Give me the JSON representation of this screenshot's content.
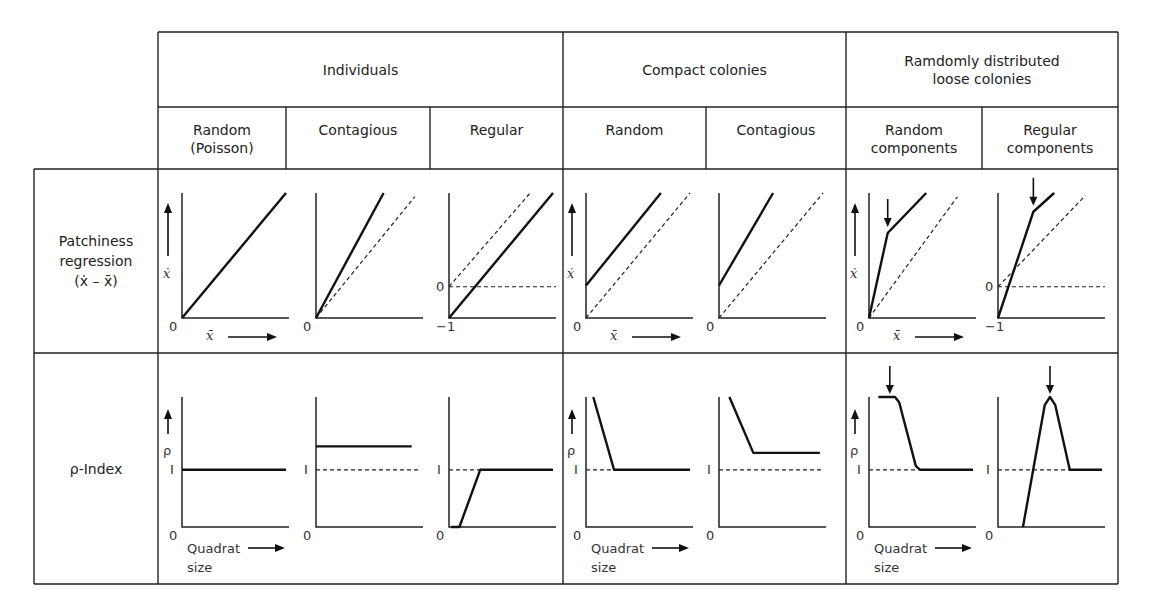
{
  "table": {
    "groups": [
      {
        "label": "Individuals"
      },
      {
        "label": "Compact colonies"
      },
      {
        "label": "Ramdomly distributed\nloose colonies"
      }
    ],
    "columns": [
      {
        "label": "Random\n(Poisson)"
      },
      {
        "label": "Contagious"
      },
      {
        "label": "Regular"
      },
      {
        "label": "Random"
      },
      {
        "label": "Contagious"
      },
      {
        "label": "Random\ncomponents"
      },
      {
        "label": "Regular\ncomponents"
      }
    ],
    "rows": [
      {
        "label": "Patchiness\nregression\n(ẋ – x̄)"
      },
      {
        "label": "ρ-Index"
      }
    ]
  },
  "axis_labels": {
    "top_y": "ẋ",
    "top_x": "x̄",
    "bottom_y": "ρ",
    "bottom_x_line1": "Quadrat",
    "bottom_x_line2": "size",
    "zero": "0",
    "minus_one": "−1",
    "one": "I"
  },
  "chart_data": [
    {
      "row": "Patchiness regression (ẋ – x̄)",
      "type": "line",
      "xlabel": "x̄",
      "ylabel": "ẋ",
      "panels": [
        {
          "column": "Random (Poisson)",
          "solid": [
            [
              0,
              0
            ],
            [
              1,
              1
            ]
          ],
          "dashed": [],
          "ymin_label": "0",
          "show_axis_labels": true
        },
        {
          "column": "Contagious",
          "solid": [
            [
              0,
              0
            ],
            [
              0.65,
              1
            ]
          ],
          "dashed": [
            [
              0,
              0
            ],
            [
              0.95,
              0.97
            ]
          ],
          "ymin_label": "0"
        },
        {
          "column": "Regular",
          "solid": [
            [
              0,
              0
            ],
            [
              1,
              1
            ]
          ],
          "dashed": [
            [
              0,
              0.25
            ],
            [
              0.78,
              1
            ]
          ],
          "hline": 0.25,
          "ymin_label": "−1",
          "extra_label": "0"
        },
        {
          "column": "Compact Random",
          "solid": [
            [
              0,
              0.26
            ],
            [
              0.72,
              1
            ]
          ],
          "dashed": [
            [
              0,
              0
            ],
            [
              1,
              1
            ]
          ],
          "ymin_label": "0",
          "show_axis_labels": true
        },
        {
          "column": "Compact Contagious",
          "solid": [
            [
              0,
              0.26
            ],
            [
              0.52,
              1
            ]
          ],
          "dashed": [
            [
              0,
              0
            ],
            [
              1,
              1
            ]
          ],
          "ymin_label": "0"
        },
        {
          "column": "Random components",
          "solid": [
            [
              0,
              0
            ],
            [
              0.18,
              0.68
            ],
            [
              0.55,
              1
            ]
          ],
          "dashed": [
            [
              0,
              0
            ],
            [
              0.85,
              0.97
            ]
          ],
          "ymin_label": "0",
          "arrow_at": [
            0.18,
            0.68
          ],
          "show_axis_labels": true
        },
        {
          "column": "Regular components",
          "solid": [
            [
              0,
              0
            ],
            [
              0.34,
              0.85
            ],
            [
              0.54,
              1
            ]
          ],
          "dashed": [
            [
              0,
              0.25
            ],
            [
              0.84,
              0.98
            ]
          ],
          "hline": 0.25,
          "ymin_label": "−1",
          "extra_label": "0",
          "arrow_at": [
            0.34,
            0.85
          ]
        }
      ]
    },
    {
      "row": "ρ-Index",
      "type": "line",
      "xlabel": "Quadrat size",
      "ylabel": "ρ",
      "one_level": 0.44,
      "panels": [
        {
          "column": "Random (Poisson)",
          "solid": [
            [
              0,
              0.44
            ],
            [
              1,
              0.44
            ]
          ],
          "dashed": [],
          "ymin_label": "0",
          "show_axis_labels": true
        },
        {
          "column": "Contagious",
          "solid": [
            [
              0,
              0.62
            ],
            [
              0.92,
              0.62
            ]
          ],
          "dashed": [
            [
              0,
              0.44
            ],
            [
              1,
              0.44
            ]
          ],
          "ymin_label": "0"
        },
        {
          "column": "Regular",
          "solid": [
            [
              0.02,
              0
            ],
            [
              0.1,
              0
            ],
            [
              0.3,
              0.44
            ],
            [
              1,
              0.44
            ]
          ],
          "dashed": [
            [
              0,
              0.44
            ],
            [
              0.3,
              0.44
            ]
          ],
          "ymin_label": "0"
        },
        {
          "column": "Compact Random",
          "solid": [
            [
              0.07,
              1
            ],
            [
              0.27,
              0.44
            ],
            [
              1,
              0.44
            ]
          ],
          "dashed": [
            [
              0,
              0.44
            ],
            [
              0.27,
              0.44
            ]
          ],
          "ymin_label": "0",
          "show_axis_labels": true
        },
        {
          "column": "Compact Contagious",
          "solid": [
            [
              0.1,
              1
            ],
            [
              0.33,
              0.57
            ],
            [
              0.97,
              0.57
            ]
          ],
          "dashed": [
            [
              0,
              0.44
            ],
            [
              1,
              0.44
            ]
          ],
          "ymin_label": "0"
        },
        {
          "column": "Random components",
          "solid": [
            [
              0.09,
              1
            ],
            [
              0.25,
              1
            ],
            [
              0.29,
              0.96
            ],
            [
              0.45,
              0.47
            ],
            [
              0.49,
              0.44
            ],
            [
              1,
              0.44
            ]
          ],
          "dashed": [
            [
              0,
              0.44
            ],
            [
              0.45,
              0.44
            ]
          ],
          "ymin_label": "0",
          "arrow_at": [
            0.2,
            1
          ],
          "show_axis_labels": true
        },
        {
          "column": "Regular components",
          "solid": [
            [
              0.24,
              0
            ],
            [
              0.45,
              0.94
            ],
            [
              0.5,
              1
            ],
            [
              0.55,
              0.94
            ],
            [
              0.69,
              0.44
            ],
            [
              1,
              0.44
            ]
          ],
          "dashed": [
            [
              0,
              0.44
            ],
            [
              0.69,
              0.44
            ]
          ],
          "ymin_label": "0",
          "arrow_at": [
            0.5,
            1
          ]
        }
      ]
    }
  ]
}
